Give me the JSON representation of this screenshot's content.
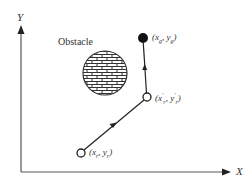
{
  "diagram": {
    "axes": {
      "x_label": "X",
      "y_label": "Y"
    },
    "obstacle": {
      "label": "Obstacle",
      "fill_pattern": "brick"
    },
    "points": {
      "start": {
        "label_open": "(",
        "x": "x",
        "x_sub": "r",
        "sep": ", ",
        "y": "y",
        "y_sub": "r",
        "label_close": ")",
        "marker": "open-circle"
      },
      "intermediate": {
        "label_open": "(",
        "x": "x",
        "x_sub": "r",
        "x_prime": "′",
        "sep": ", ",
        "y": "y",
        "y_sub": "r",
        "y_prime": "′",
        "label_close": ")",
        "marker": "open-circle"
      },
      "goal": {
        "label_open": "(",
        "x": "x",
        "x_sub": "g",
        "sep": ", ",
        "y": "y",
        "y_sub": "g",
        "label_close": ")",
        "marker": "filled-circle"
      }
    },
    "path": {
      "segments": [
        "start → intermediate",
        "intermediate → goal"
      ]
    },
    "colors": {
      "line": "#333333",
      "background": "#ffffff"
    }
  }
}
